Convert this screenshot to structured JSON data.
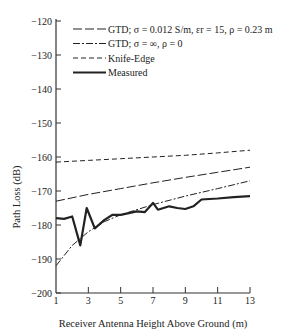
{
  "chart_data": {
    "type": "line",
    "title": "",
    "xlabel": "Receiver Antenna Height Above Ground (m)",
    "ylabel": "Path Loss (dB)",
    "xlim": [
      1,
      13
    ],
    "ylim": [
      -200,
      -120
    ],
    "xticks": [
      1,
      3,
      5,
      7,
      9,
      11,
      13
    ],
    "yticks": [
      -120,
      -130,
      -140,
      -150,
      -160,
      -170,
      -180,
      -190,
      -200
    ],
    "grid": false,
    "legend_position": "upper left",
    "series": [
      {
        "name": "GTD; σ = 0.012 S/m, εr = 15, ρ = 0.23 m",
        "style": "long-dash",
        "x": [
          1,
          3,
          5,
          7,
          9,
          11,
          13
        ],
        "y": [
          -173,
          -171,
          -169.3,
          -167.6,
          -166,
          -164.5,
          -163
        ]
      },
      {
        "name": "GTD; σ = ∞, ρ = 0",
        "style": "dash-dot",
        "x": [
          1,
          2,
          3,
          4,
          5,
          7,
          9,
          11,
          13
        ],
        "y": [
          -192,
          -186,
          -182,
          -179,
          -177,
          -174,
          -171.5,
          -169.3,
          -167
        ]
      },
      {
        "name": "Knife-Edge",
        "style": "short-dash",
        "x": [
          1,
          3,
          5,
          7,
          9,
          11,
          13
        ],
        "y": [
          -161.5,
          -161,
          -160.5,
          -160,
          -159.5,
          -158.8,
          -158
        ]
      },
      {
        "name": "Measured",
        "style": "solid-thick",
        "x": [
          1,
          1.5,
          2,
          2.5,
          2.9,
          3.4,
          4,
          4.5,
          5,
          5.5,
          6,
          6.5,
          7,
          7.3,
          8,
          8.5,
          9,
          9.5,
          10,
          11,
          12,
          13
        ],
        "y": [
          -178,
          -178.2,
          -177.5,
          -186,
          -175,
          -181,
          -178.5,
          -177,
          -177,
          -176.5,
          -176,
          -176.2,
          -173.5,
          -175.5,
          -174.5,
          -175,
          -175.3,
          -174.5,
          -172.5,
          -172.2,
          -171.8,
          -171.5
        ]
      }
    ]
  },
  "legend": [
    "GTD; σ = 0.012 S/m, εr = 15, ρ = 0.23 m",
    "GTD; σ = ∞, ρ = 0",
    "Knife-Edge",
    "Measured"
  ]
}
